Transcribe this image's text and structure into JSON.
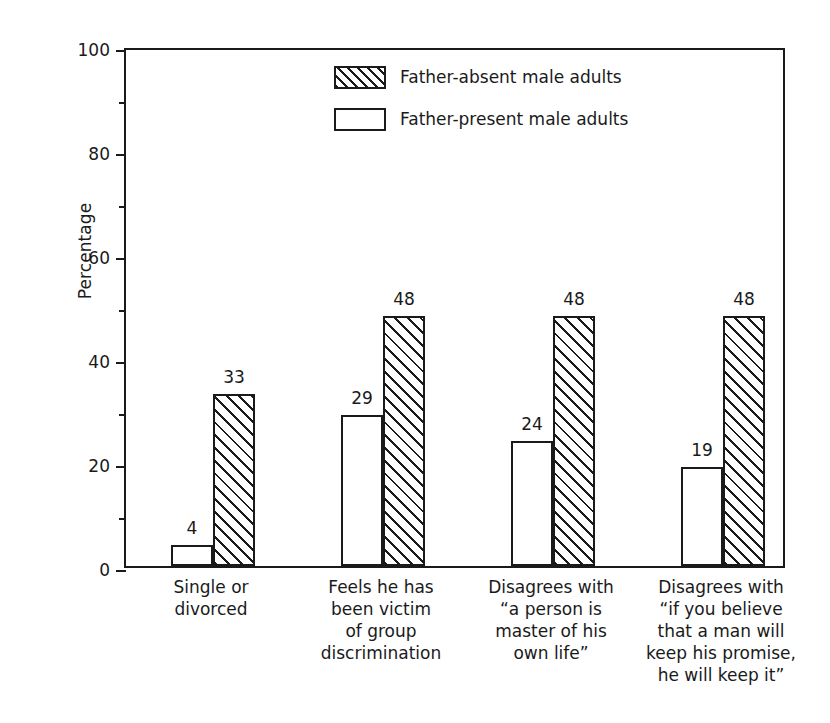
{
  "chart_data": {
    "type": "bar",
    "title": "",
    "xlabel": "",
    "ylabel": "Percentage",
    "ylim": [
      0,
      100
    ],
    "ytick_labels": [
      "0",
      "20",
      "40",
      "60",
      "80",
      "100"
    ],
    "ytick_values": [
      0,
      20,
      40,
      60,
      80,
      100
    ],
    "minor_tick_values": [
      10,
      30,
      50,
      70,
      90
    ],
    "grid": false,
    "legend_position": "top-center-inside",
    "categories": [
      "Single or\ndivorced",
      "Feels he has\nbeen victim\nof group\ndiscrimination",
      "Disagrees with\n“a person is\nmaster of his\nown life”",
      "Disagrees with\n“if you believe\nthat a man will\nkeep his promise,\nhe will keep it”"
    ],
    "series": [
      {
        "name": "Father-present male adults",
        "fill": "white",
        "values": [
          4,
          29,
          24,
          19
        ],
        "labels": [
          "4",
          "29",
          "24",
          "19"
        ]
      },
      {
        "name": "Father-absent male adults",
        "fill": "hatched",
        "values": [
          33,
          48,
          48,
          48
        ],
        "labels": [
          "33",
          "48",
          "48",
          "48"
        ]
      }
    ],
    "legend": [
      {
        "label": "Father-absent male adults",
        "fill": "hatched"
      },
      {
        "label": "Father-present male adults",
        "fill": "white"
      }
    ],
    "colors": {
      "line": "#1a1a1a",
      "background": "#ffffff",
      "hatch": "#1a1a1a"
    }
  }
}
